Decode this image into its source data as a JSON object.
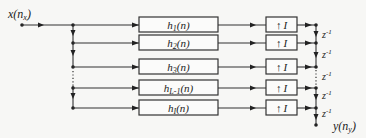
{
  "diagram": {
    "type": "polyphase filter bank (interpolation)",
    "input_label": {
      "base": "x",
      "paren_open": "(",
      "var": "n",
      "sub": "x",
      "paren_close": ")"
    },
    "output_label": {
      "base": "y",
      "paren_open": "(",
      "var": "n",
      "sub": "y",
      "paren_close": ")"
    },
    "branches": [
      {
        "filter": {
          "base": "h",
          "sub": "1",
          "arg": "(n)"
        },
        "upsampler": {
          "symbol": "↑",
          "factor": "I"
        }
      },
      {
        "filter": {
          "base": "h",
          "sub": "2",
          "arg": "(n)"
        },
        "upsampler": {
          "symbol": "↑",
          "factor": "I"
        }
      },
      {
        "filter": {
          "base": "h",
          "sub": "3",
          "arg": "(n)"
        },
        "upsampler": {
          "symbol": "↑",
          "factor": "I"
        }
      },
      {
        "filter": {
          "base": "h",
          "sub": "L-1",
          "arg": "(n)"
        },
        "upsampler": {
          "symbol": "↑",
          "factor": "I"
        }
      },
      {
        "filter": {
          "base": "h",
          "sub": "I",
          "arg": "(n)"
        },
        "upsampler": {
          "symbol": "↑",
          "factor": "I"
        }
      }
    ],
    "delays": [
      {
        "base": "z",
        "exp": "-1"
      },
      {
        "base": "z",
        "exp": "-1"
      },
      {
        "base": "z",
        "exp": "-1"
      },
      {
        "base": "z",
        "exp": "-1"
      },
      {
        "base": "z",
        "exp": "-1"
      }
    ]
  }
}
